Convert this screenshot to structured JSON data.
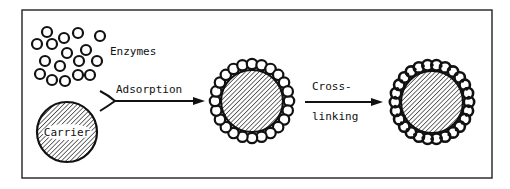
{
  "diagram": {
    "labels": {
      "enzymes": "Enzymes",
      "carrier": "Carrier",
      "adsorption": "Adsorption",
      "cross_line1": "Cross-",
      "cross_line2": "linking"
    },
    "enzymes": [
      [
        47,
        32
      ],
      [
        78,
        33
      ],
      [
        100,
        36
      ],
      [
        37,
        44
      ],
      [
        52,
        44
      ],
      [
        64,
        38
      ],
      [
        86,
        50
      ],
      [
        67,
        53
      ],
      [
        45,
        61
      ],
      [
        60,
        66
      ],
      [
        79,
        61
      ],
      [
        97,
        61
      ],
      [
        40,
        74
      ],
      [
        52,
        80
      ],
      [
        65,
        81
      ],
      [
        78,
        75
      ],
      [
        90,
        75
      ]
    ],
    "enzyme_radius": 5,
    "carrier": {
      "cx": 67,
      "cy": 132,
      "r": 30
    },
    "adsorbed_particle": {
      "cx": 252,
      "cy": 101,
      "core_r": 31,
      "bead_ring_r": 37,
      "bead_r": 5.2,
      "bead_count": 24
    },
    "crosslinked_particle": {
      "cx": 432,
      "cy": 102,
      "core_r": 31,
      "bead_ring_r": 37,
      "bead_r": 5.2,
      "bead_count": 26
    },
    "frame": {
      "x": 22,
      "y": 10,
      "w": 470,
      "h": 168
    },
    "colors": {
      "stroke": "#111111",
      "background": "#ffffff"
    }
  }
}
